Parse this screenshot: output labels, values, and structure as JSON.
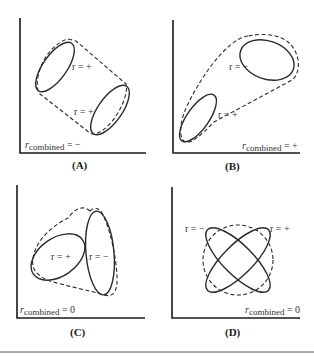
{
  "panels": [
    {
      "id": "A",
      "label": "(A)",
      "subgroups": [
        {
          "r": "r = +"
        },
        {
          "r": "r = +"
        }
      ],
      "combined": {
        "prefix": "r",
        "sub": "combined",
        "value": " = −"
      }
    },
    {
      "id": "B",
      "label": "(B)",
      "subgroups": [
        {
          "r": "r = −"
        },
        {
          "r": "r = +"
        }
      ],
      "combined": {
        "prefix": "r",
        "sub": "combined",
        "value": " = +"
      }
    },
    {
      "id": "C",
      "label": "(C)",
      "subgroups": [
        {
          "r": "r = +"
        },
        {
          "r": "r = −"
        }
      ],
      "combined": {
        "prefix": "r",
        "sub": "combined",
        "value": " = 0"
      }
    },
    {
      "id": "D",
      "label": "(D)",
      "subgroups": [
        {
          "r": "r = −"
        },
        {
          "r": "r = +"
        }
      ],
      "combined": {
        "prefix": "r",
        "sub": "combined",
        "value": " = 0"
      }
    }
  ]
}
